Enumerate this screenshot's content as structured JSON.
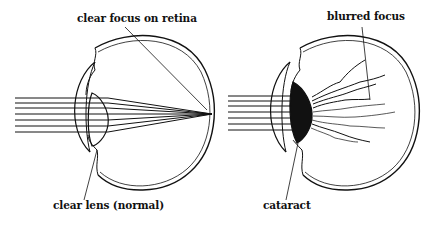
{
  "diagram": {
    "panels": [
      {
        "id": "normal-eye",
        "labels": {
          "top": "clear focus on retina",
          "bottom": "clear lens (normal)"
        }
      },
      {
        "id": "cataract-eye",
        "labels": {
          "top": "blurred focus",
          "bottom": "cataract"
        }
      }
    ],
    "colors": {
      "line": "#111111",
      "background": "#ffffff"
    }
  }
}
